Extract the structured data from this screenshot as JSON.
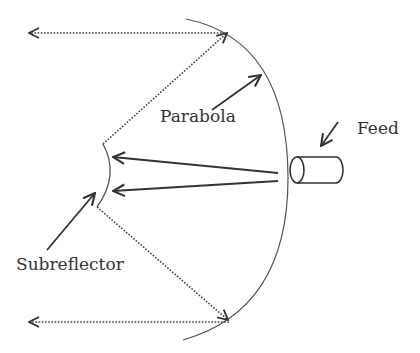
{
  "diagram": {
    "labels": {
      "parabola": "Parabola",
      "feed": "Feed",
      "subreflector": "Subreflector"
    },
    "colors": {
      "stroke": "#333333",
      "background": "#ffffff"
    }
  }
}
